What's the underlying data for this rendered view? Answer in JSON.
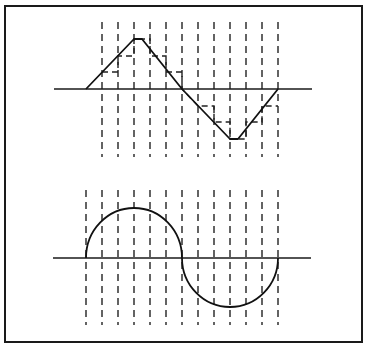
{
  "figure": {
    "frame": {
      "x": 5,
      "y": 6,
      "width": 357,
      "height": 336
    },
    "top_panel": {
      "label": "triangle wave with staircase approximation",
      "axis_y": 89,
      "axis_x1": 54,
      "axis_x2": 312,
      "sample_lines_x": [
        102,
        118,
        134,
        150,
        166,
        182,
        198,
        214,
        230,
        246,
        262,
        278
      ],
      "sample_line_y1": 22,
      "sample_line_y2": 157,
      "wave_points": [
        [
          86,
          89
        ],
        [
          134,
          39
        ],
        [
          142,
          39
        ],
        [
          182,
          89
        ],
        [
          230,
          139
        ],
        [
          238,
          139
        ],
        [
          278,
          89
        ]
      ],
      "step_points": [
        [
          102,
          72
        ],
        [
          118,
          72
        ],
        [
          118,
          56
        ],
        [
          134,
          56
        ],
        [
          134,
          39
        ],
        [
          150,
          39
        ],
        [
          150,
          56
        ],
        [
          166,
          56
        ],
        [
          166,
          72
        ],
        [
          182,
          72
        ],
        [
          182,
          89
        ],
        [
          198,
          106
        ],
        [
          214,
          106
        ],
        [
          214,
          122
        ],
        [
          230,
          122
        ],
        [
          230,
          139
        ],
        [
          246,
          139
        ],
        [
          246,
          122
        ],
        [
          262,
          122
        ],
        [
          262,
          106
        ],
        [
          278,
          106
        ]
      ]
    },
    "bottom_panel": {
      "label": "sine wave approximated by semicircles",
      "axis_y": 258,
      "axis_x1": 53,
      "axis_x2": 311,
      "sample_lines_x": [
        86,
        102,
        118,
        134,
        150,
        166,
        182,
        198,
        214,
        230,
        246,
        262,
        278
      ],
      "sample_line_y1": 190,
      "sample_line_y2": 325,
      "upper_lobe": {
        "x1": 86,
        "x2": 182,
        "peak_y": 208
      },
      "lower_lobe": {
        "x1": 182,
        "x2": 278,
        "trough_y": 307
      }
    }
  }
}
